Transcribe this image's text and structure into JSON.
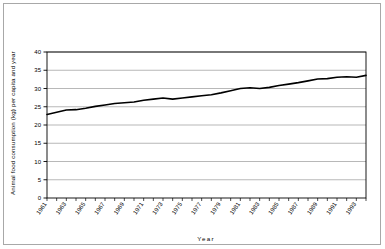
{
  "chart_data": {
    "type": "line",
    "title": "",
    "xlabel": "Year",
    "ylabel": "Animal food consumption (kg) per capita and year",
    "ylim": [
      0,
      40
    ],
    "ytick_labels": [
      "0",
      "5",
      "10",
      "15",
      "20",
      "25",
      "30",
      "35",
      "40"
    ],
    "ytick_values": [
      0,
      5,
      10,
      15,
      20,
      25,
      30,
      35,
      40
    ],
    "xtick_labels": [
      "1961",
      "1963",
      "1965",
      "1967",
      "1969",
      "1971",
      "1973",
      "1975",
      "1977",
      "1979",
      "1981",
      "1983",
      "1985",
      "1987",
      "1989",
      "1991",
      "1993"
    ],
    "grid": "horizontal",
    "legend": "none",
    "line_color": "#000000",
    "x": [
      1961,
      1962,
      1963,
      1964,
      1965,
      1966,
      1967,
      1968,
      1969,
      1970,
      1971,
      1972,
      1973,
      1974,
      1975,
      1976,
      1977,
      1978,
      1979,
      1980,
      1981,
      1982,
      1983,
      1984,
      1985,
      1986,
      1987,
      1988,
      1989,
      1990,
      1991,
      1992,
      1993,
      1994
    ],
    "values": [
      22.9,
      23.5,
      24.1,
      24.2,
      24.6,
      25.1,
      25.5,
      25.9,
      26.1,
      26.3,
      26.8,
      27.1,
      27.4,
      27.1,
      27.4,
      27.7,
      28.0,
      28.3,
      28.8,
      29.4,
      30.0,
      30.2,
      30.0,
      30.3,
      30.8,
      31.2,
      31.6,
      32.1,
      32.6,
      32.7,
      33.1,
      33.2,
      33.1,
      33.6
    ],
    "series_name": "Animal food consumption"
  },
  "figure": {
    "y_axis_title": "Animal food consumption (kg) per capita and year",
    "x_axis_title": "Year"
  }
}
